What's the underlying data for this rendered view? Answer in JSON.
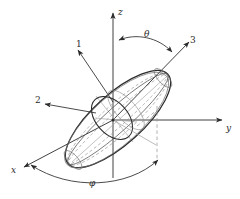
{
  "figure": {
    "background_color": "#ffffff",
    "line_color": "#2b2b2b",
    "faint_line_color": "#9a9a9a",
    "dashed_line_color": "#8d8d8d",
    "axes": [
      {
        "id": "z",
        "label": "z",
        "label_x": 118,
        "label_y": 8,
        "kind": "cartesian-axis"
      },
      {
        "id": "y",
        "label": "y",
        "label_x": 226,
        "label_y": 128,
        "kind": "cartesian-axis"
      },
      {
        "id": "x",
        "label": "x",
        "label_x": 11,
        "label_y": 166,
        "kind": "cartesian-axis"
      }
    ],
    "body_axes": [
      {
        "id": "1",
        "label": "1",
        "label_x": 76,
        "label_y": 40,
        "kind": "principal-axis"
      },
      {
        "id": "2",
        "label": "2",
        "label_x": 35,
        "label_y": 101,
        "kind": "principal-axis"
      },
      {
        "id": "3",
        "label": "3",
        "label_x": 190,
        "label_y": 36,
        "kind": "principal-axis"
      }
    ],
    "angles": [
      {
        "id": "theta",
        "label": "θ",
        "label_x": 144,
        "label_y": 32,
        "between": [
          "z",
          "3"
        ]
      },
      {
        "id": "phi",
        "label": "φ",
        "label_x": 89,
        "label_y": 180,
        "between": [
          "x",
          "projection"
        ]
      }
    ],
    "shape": {
      "name": "ellipsoid",
      "type": "prolate-spheroid",
      "tilt_label": "θ",
      "azimuth_label": "φ"
    }
  }
}
